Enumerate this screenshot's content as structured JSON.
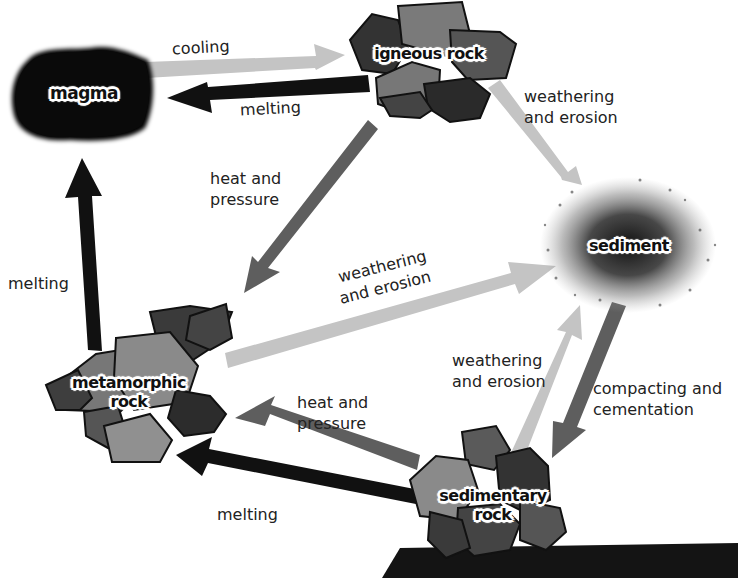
{
  "diagram": {
    "nodes": {
      "magma": {
        "label": "magma"
      },
      "igneous": {
        "label": "igneous rock"
      },
      "sediment": {
        "label": "sediment"
      },
      "metamorphic": {
        "label_line1": "metamorphic",
        "label_line2": "rock"
      },
      "sedimentary": {
        "label_line1": "sedimentary",
        "label_line2": "rock"
      }
    },
    "edges": [
      {
        "from": "magma",
        "to": "igneous rock",
        "label": "cooling",
        "shade": "light"
      },
      {
        "from": "igneous rock",
        "to": "magma",
        "label": "melting",
        "shade": "black"
      },
      {
        "from": "igneous rock",
        "to": "sediment",
        "label_line1": "weathering",
        "label_line2": "and erosion",
        "shade": "light"
      },
      {
        "from": "igneous rock",
        "to": "metamorphic rock",
        "label_line1": "heat and",
        "label_line2": "pressure",
        "shade": "mid"
      },
      {
        "from": "metamorphic rock",
        "to": "magma",
        "label": "melting",
        "shade": "black"
      },
      {
        "from": "metamorphic rock",
        "to": "sediment",
        "label_line1": "weathering",
        "label_line2": "and erosion",
        "shade": "light"
      },
      {
        "from": "sedimentary rock",
        "to": "sediment",
        "label_line1": "weathering",
        "label_line2": "and erosion",
        "shade": "light"
      },
      {
        "from": "sediment",
        "to": "sedimentary rock",
        "label_line1": "compacting and",
        "label_line2": "cementation",
        "shade": "mid"
      },
      {
        "from": "sedimentary rock",
        "to": "metamorphic rock",
        "label_line1": "heat and",
        "label_line2": "pressure",
        "shade": "mid"
      },
      {
        "from": "sedimentary rock",
        "to": "metamorphic rock",
        "label": "melting",
        "shade": "black"
      }
    ],
    "colors": {
      "arrow_light": "#c4c4c4",
      "arrow_mid": "#5e5e5e",
      "arrow_black": "#111111",
      "rock_dark": "#2e2e2e",
      "rock_mid": "#5a5a5a",
      "rock_light": "#8a8a8a",
      "ground": "#111111"
    }
  }
}
